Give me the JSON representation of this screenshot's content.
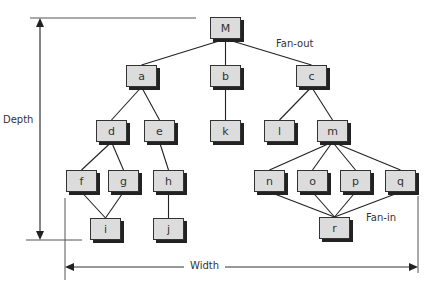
{
  "diagram": {
    "type": "tree-structure",
    "labels": {
      "depth": "Depth",
      "width": "Width",
      "fan_out": "Fan-out",
      "fan_in": "Fan-in"
    },
    "nodes": [
      {
        "id": "M",
        "x": 210,
        "y": 17
      },
      {
        "id": "a",
        "x": 126,
        "y": 65
      },
      {
        "id": "b",
        "x": 210,
        "y": 65
      },
      {
        "id": "c",
        "x": 296,
        "y": 65
      },
      {
        "id": "d",
        "x": 96,
        "y": 120
      },
      {
        "id": "e",
        "x": 144,
        "y": 120
      },
      {
        "id": "k",
        "x": 210,
        "y": 120
      },
      {
        "id": "l",
        "x": 264,
        "y": 120
      },
      {
        "id": "m",
        "x": 317,
        "y": 120
      },
      {
        "id": "f",
        "x": 66,
        "y": 170
      },
      {
        "id": "g",
        "x": 108,
        "y": 170
      },
      {
        "id": "h",
        "x": 153,
        "y": 170
      },
      {
        "id": "n",
        "x": 254,
        "y": 170
      },
      {
        "id": "o",
        "x": 297,
        "y": 170
      },
      {
        "id": "p",
        "x": 340,
        "y": 170
      },
      {
        "id": "q",
        "x": 385,
        "y": 170
      },
      {
        "id": "i",
        "x": 90,
        "y": 218
      },
      {
        "id": "j",
        "x": 153,
        "y": 218
      },
      {
        "id": "r",
        "x": 319,
        "y": 217
      }
    ],
    "edges": [
      [
        "M",
        "a"
      ],
      [
        "M",
        "b"
      ],
      [
        "M",
        "c"
      ],
      [
        "a",
        "d"
      ],
      [
        "a",
        "e"
      ],
      [
        "b",
        "k"
      ],
      [
        "c",
        "l"
      ],
      [
        "c",
        "m"
      ],
      [
        "d",
        "f"
      ],
      [
        "d",
        "g"
      ],
      [
        "e",
        "h"
      ],
      [
        "m",
        "n"
      ],
      [
        "m",
        "o"
      ],
      [
        "m",
        "p"
      ],
      [
        "m",
        "q"
      ],
      [
        "f",
        "i"
      ],
      [
        "g",
        "i"
      ],
      [
        "h",
        "j"
      ],
      [
        "n",
        "r"
      ],
      [
        "o",
        "r"
      ],
      [
        "p",
        "r"
      ],
      [
        "q",
        "r"
      ]
    ]
  }
}
